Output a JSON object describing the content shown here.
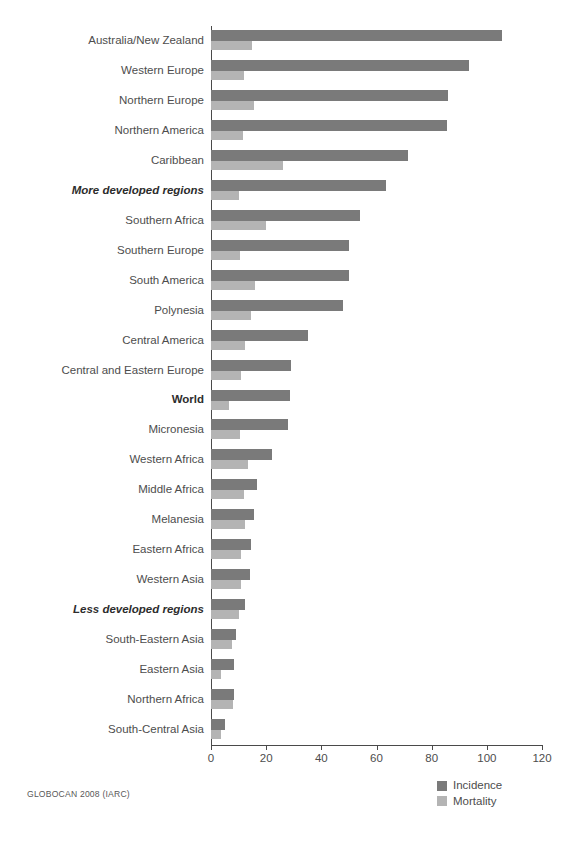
{
  "source_note": "GLOBOCAN 2008 (IARC)",
  "legend": {
    "position": "bottom-right",
    "items": [
      {
        "label": "Incidence",
        "color": "#7a7a7a",
        "swatch": "incidence-swatch"
      },
      {
        "label": "Mortality",
        "color": "#b4b4b4",
        "swatch": "mortality-swatch"
      }
    ]
  },
  "axis": {
    "tick_labels": [
      "0",
      "20",
      "40",
      "60",
      "80",
      "100",
      "120"
    ],
    "min": 0,
    "max": 120
  },
  "chart_data": {
    "type": "bar",
    "orientation": "horizontal",
    "title": "",
    "subtitle": "",
    "xlabel": "",
    "ylabel": "",
    "xlim": [
      0,
      120
    ],
    "xticks": [
      0,
      20,
      40,
      60,
      80,
      100,
      120
    ],
    "grid": false,
    "legend_position": "bottom-right",
    "source": "GLOBOCAN 2008 (IARC)",
    "categories": [
      "Australia/New Zealand",
      "Western Europe",
      "Northern Europe",
      "Northern America",
      "Caribbean",
      "More developed regions",
      "Southern Africa",
      "Southern Europe",
      "South America",
      "Polynesia",
      "Central America",
      "Central and Eastern Europe",
      "World",
      "Micronesia",
      "Western Africa",
      "Middle Africa",
      "Melanesia",
      "Eastern Africa",
      "Western Asia",
      "Less developed regions",
      "South-Eastern Asia",
      "Eastern Asia",
      "Northern Africa",
      "South-Central Asia"
    ],
    "emphasized_categories": [
      "More developed regions",
      "World",
      "Less developed regions"
    ],
    "series": [
      {
        "name": "Incidence",
        "color": "#7a7a7a",
        "values": [
          105.5,
          93.5,
          86.0,
          85.5,
          71.5,
          63.5,
          54.0,
          50.0,
          50.0,
          48.0,
          35.0,
          29.0,
          28.5,
          28.0,
          22.0,
          16.5,
          15.5,
          14.5,
          14.0,
          12.5,
          9.0,
          8.5,
          8.5,
          5.0
        ]
      },
      {
        "name": "Mortality",
        "color": "#b4b4b4",
        "values": [
          15.0,
          12.0,
          15.5,
          11.5,
          26.0,
          10.0,
          20.0,
          10.5,
          16.0,
          14.5,
          12.5,
          11.0,
          6.5,
          10.5,
          13.5,
          12.0,
          12.5,
          11.0,
          11.0,
          10.0,
          7.5,
          3.5,
          8.0,
          3.5
        ]
      }
    ]
  }
}
